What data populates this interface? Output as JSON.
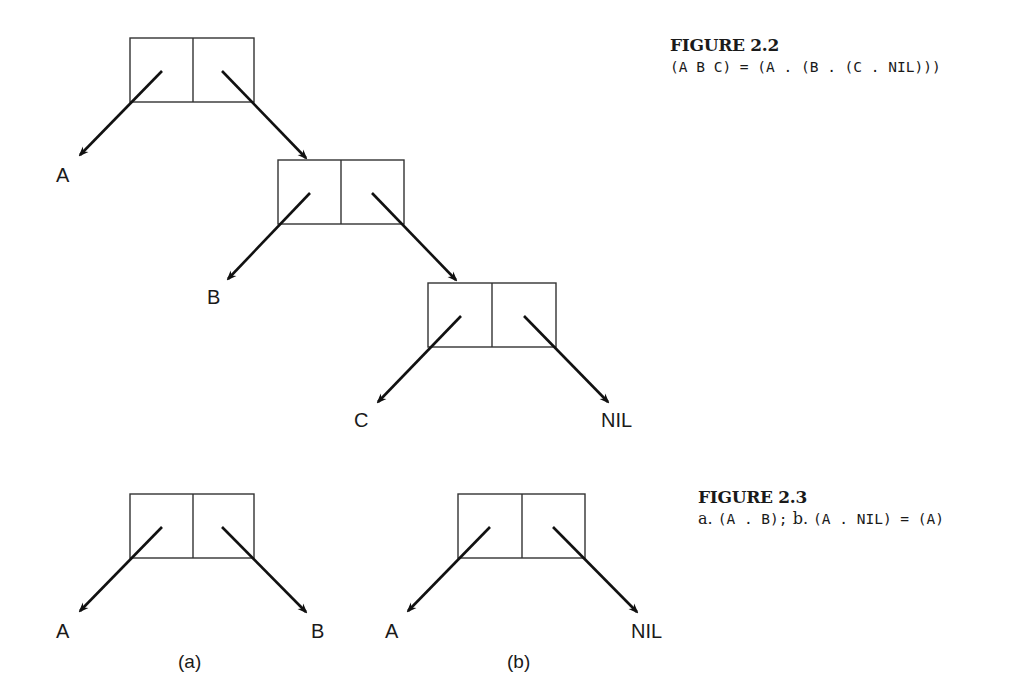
{
  "figure_2_2": {
    "title": "FIGURE 2.2",
    "caption": "(A B C) = (A . (B . (C . NIL)))",
    "cells": [
      {
        "x": 130,
        "y": 38,
        "w": 124,
        "h": 64,
        "car": "A",
        "cdr": "next"
      },
      {
        "x": 278,
        "y": 160,
        "w": 126,
        "h": 64,
        "car": "B",
        "cdr": "next"
      },
      {
        "x": 428,
        "y": 283,
        "w": 128,
        "h": 64,
        "car": "C",
        "cdr": "NIL"
      }
    ],
    "labels": {
      "a": "A",
      "b": "B",
      "c": "C",
      "nil": "NIL"
    }
  },
  "figure_2_3": {
    "title": "FIGURE 2.3",
    "caption_a_prefix": "a. ",
    "caption_a_expr": "(A . B);",
    "caption_b_prefix": " b. ",
    "caption_b_expr": "(A . NIL) = (A)",
    "diagram_a": {
      "car_label": "A",
      "cdr_label": "B",
      "sublabel": "(a)"
    },
    "diagram_b": {
      "car_label": "A",
      "cdr_label": "NIL",
      "sublabel": "(b)"
    }
  }
}
